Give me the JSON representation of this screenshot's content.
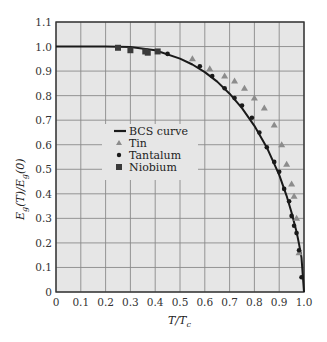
{
  "chart_data": {
    "type": "scatter",
    "title": "",
    "xlabel": "T/T_c",
    "ylabel": "E_g(T)/E_g(0)",
    "xlim": [
      0,
      1.0
    ],
    "ylim": [
      0,
      1.1
    ],
    "xticks": [
      "0",
      "0.1",
      "0.2",
      "0.3",
      "0.4",
      "0.5",
      "0.6",
      "0.7",
      "0.8",
      "0.9",
      "1.0"
    ],
    "yticks": [
      "0",
      "0.1",
      "0.2",
      "0.3",
      "0.4",
      "0.5",
      "0.6",
      "0.7",
      "0.8",
      "0.9",
      "1.0",
      "1.1"
    ],
    "grid": true,
    "legend_position": "center-left",
    "colors": {
      "plot_background": "#e6e6e6",
      "grid": "#8a8a8a",
      "curve": "#1a1a1a",
      "tin": "#8c8c8c",
      "tantalum": "#1a1a1a",
      "niobium": "#3a3a3a"
    },
    "series": [
      {
        "name": "BCS curve",
        "kind": "line",
        "x": [
          0,
          0.2,
          0.3,
          0.4,
          0.5,
          0.55,
          0.6,
          0.65,
          0.7,
          0.75,
          0.8,
          0.85,
          0.9,
          0.93,
          0.95,
          0.97,
          0.98,
          0.99,
          1.0
        ],
        "y": [
          1.0,
          1.0,
          0.998,
          0.985,
          0.951,
          0.927,
          0.896,
          0.857,
          0.808,
          0.749,
          0.677,
          0.589,
          0.477,
          0.392,
          0.323,
          0.245,
          0.196,
          0.14,
          0.0
        ]
      },
      {
        "name": "Tin",
        "kind": "triangle",
        "x": [
          0.55,
          0.62,
          0.68,
          0.72,
          0.76,
          0.8,
          0.84,
          0.88,
          0.91,
          0.93,
          0.95,
          0.96,
          0.97,
          0.98
        ],
        "y": [
          0.95,
          0.91,
          0.88,
          0.86,
          0.83,
          0.79,
          0.75,
          0.68,
          0.6,
          0.52,
          0.44,
          0.39,
          0.3,
          0.16
        ]
      },
      {
        "name": "Tantalum",
        "kind": "dot",
        "x": [
          0.45,
          0.58,
          0.63,
          0.68,
          0.72,
          0.75,
          0.79,
          0.82,
          0.85,
          0.88,
          0.9,
          0.92,
          0.94,
          0.95,
          0.96,
          0.97,
          0.98,
          0.99
        ],
        "y": [
          0.97,
          0.92,
          0.88,
          0.83,
          0.79,
          0.76,
          0.71,
          0.65,
          0.59,
          0.53,
          0.49,
          0.42,
          0.37,
          0.31,
          0.27,
          0.24,
          0.17,
          0.06
        ]
      },
      {
        "name": "Niobium",
        "kind": "square",
        "x": [
          0.25,
          0.3,
          0.36,
          0.37,
          0.41
        ],
        "y": [
          0.995,
          0.985,
          0.98,
          0.975,
          0.98
        ]
      }
    ],
    "legend": [
      "BCS curve",
      "Tin",
      "Tantalum",
      "Niobium"
    ]
  },
  "axis": {
    "x_label_main": "T/T",
    "x_label_sub": "c",
    "y_label_main": "E",
    "y_label_sub": "g",
    "y_label_rest": "(T)/E",
    "y_label_sub2": "g",
    "y_label_end": "(0)"
  }
}
